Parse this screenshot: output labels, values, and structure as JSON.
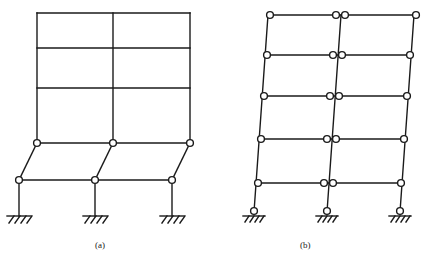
{
  "figure": {
    "type": "structural-collapse-mechanism-diagram",
    "background_color": "#ffffff",
    "line_color": "#1a1a1a",
    "hinge_fill": "#ffffff",
    "width": 422,
    "height": 262
  },
  "captions": {
    "panel_a": "(a)",
    "panel_b": "(b)"
  },
  "panels": [
    {
      "id": "a",
      "label": "(a)",
      "mechanism": "soft-story-column-sway",
      "bays": 2,
      "stories": 4,
      "hinge_count": 6,
      "support_type": "fixed",
      "support_count": 3,
      "column_x": [
        37,
        113,
        190
      ],
      "beam_levels_y": [
        13,
        48,
        88,
        143,
        180
      ],
      "hinge_row_upper_y": 143,
      "hinge_row_lower_y": 180,
      "base_y": 216,
      "sway_offset_px": 18
    },
    {
      "id": "b",
      "label": "(b)",
      "mechanism": "beam-sway-strong-column-weak-beam",
      "bays": 2,
      "stories": 5,
      "hinge_count": 23,
      "support_type": "fixed-with-base-hinge",
      "support_count": 3,
      "column_base_x": [
        254,
        327,
        400
      ],
      "column_top_x": [
        268,
        341,
        414
      ],
      "beam_levels_y": [
        15,
        55,
        96,
        139,
        183
      ],
      "base_y": 212,
      "lean_offset_px": 14
    }
  ],
  "geometry": {
    "stroke_width": 1.4,
    "hinge_radius": 3.4,
    "hatch_tick_count": 4
  }
}
